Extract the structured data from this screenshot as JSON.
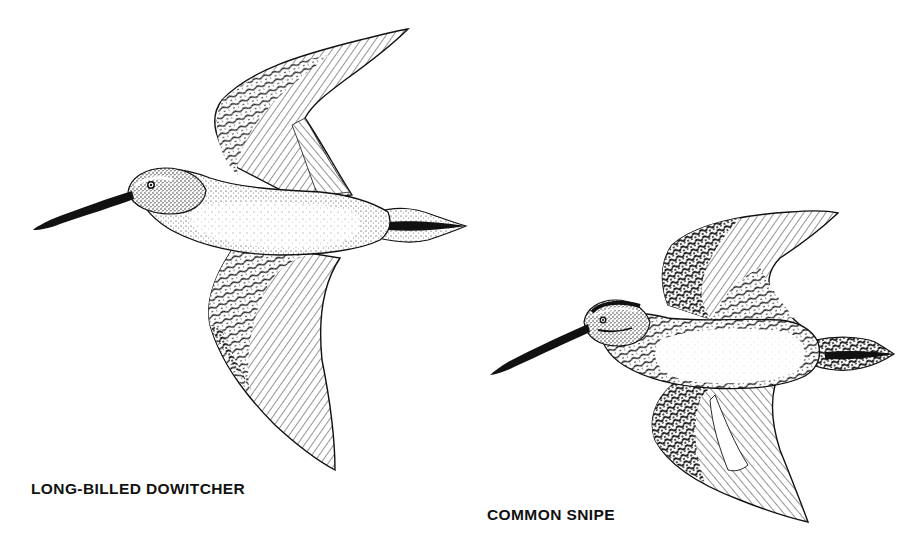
{
  "plate": {
    "background": "#ffffff",
    "ink": "#111111"
  },
  "birds": [
    {
      "id": "long-billed-dowitcher",
      "caption": "LONG-BILLED DOWITCHER",
      "pose": "flying-left, wings up-and-down"
    },
    {
      "id": "common-snipe",
      "caption": "COMMON SNIPE",
      "pose": "flying-left, wings up-and-down"
    }
  ]
}
